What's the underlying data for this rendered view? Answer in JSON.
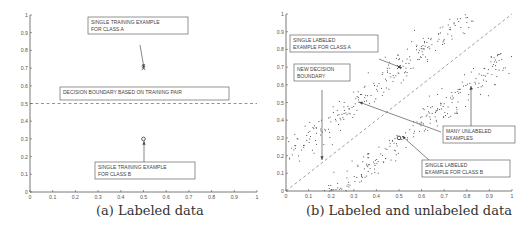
{
  "figure": {
    "panels": [
      {
        "id": "a",
        "caption": "(a) Labeled data",
        "annotations": {
          "class_a": [
            "SINGLE TRAINING EXAMPLE",
            "FOR CLASS A"
          ],
          "boundary": [
            "DECISION BOUNDARY BASED ON TRAINING PAIR"
          ],
          "class_b": [
            "SINGLE TRAINING EXAMPLE",
            "FOR CLASS B"
          ]
        }
      },
      {
        "id": "b",
        "caption": "(b) Labeled and unlabeled data",
        "annotations": {
          "class_a": [
            "SINGLE LABELED",
            "EXAMPLE FOR CLASS A"
          ],
          "boundary": [
            "NEW DECISION",
            "BOUNDARY"
          ],
          "unlabeled": [
            "MANY UNLABELED",
            "EXAMPLES"
          ],
          "class_b": [
            "SINGLE LABELED",
            "EXAMPLE FOR CLASS B"
          ]
        }
      }
    ],
    "ticks": [
      "0",
      "0.1",
      "0.2",
      "0.3",
      "0.4",
      "0.5",
      "0.6",
      "0.7",
      "0.8",
      "0.9",
      "1"
    ]
  },
  "chart_data": [
    {
      "type": "scatter",
      "title": "(a) Labeled data",
      "xlabel": "",
      "ylabel": "",
      "xlim": [
        0,
        1
      ],
      "ylim": [
        0,
        1
      ],
      "grid": false,
      "series": [
        {
          "name": "Class A labeled example",
          "marker": "x",
          "points": [
            [
              0.5,
              0.7
            ]
          ]
        },
        {
          "name": "Class B labeled example",
          "marker": "o",
          "points": [
            [
              0.5,
              0.3
            ]
          ]
        }
      ],
      "lines": [
        {
          "name": "Decision boundary based on training pair",
          "style": "dashed",
          "points": [
            [
              0,
              0.5
            ],
            [
              1,
              0.5
            ]
          ]
        }
      ],
      "annotations": [
        {
          "text": "SINGLE TRAINING EXAMPLE FOR CLASS A",
          "target": [
            0.5,
            0.7
          ]
        },
        {
          "text": "DECISION BOUNDARY BASED ON TRAINING PAIR",
          "target": [
            0.5,
            0.5
          ]
        },
        {
          "text": "SINGLE TRAINING EXAMPLE FOR CLASS B",
          "target": [
            0.5,
            0.3
          ]
        }
      ]
    },
    {
      "type": "scatter",
      "title": "(b) Labeled and unlabeled data",
      "xlabel": "",
      "ylabel": "",
      "xlim": [
        0,
        1
      ],
      "ylim": [
        0,
        1
      ],
      "grid": false,
      "series": [
        {
          "name": "Class A labeled example",
          "marker": "x",
          "points": [
            [
              0.5,
              0.7
            ]
          ]
        },
        {
          "name": "Class B labeled example",
          "marker": "o",
          "points": [
            [
              0.5,
              0.3
            ]
          ]
        },
        {
          "name": "Unlabeled cluster A (upper band, approx y = x + 0.2)",
          "marker": ".",
          "x_range": [
            0,
            0.9
          ],
          "y_range": [
            0.1,
            1.0
          ]
        },
        {
          "name": "Unlabeled cluster B (lower band, approx y = x - 0.2)",
          "marker": ".",
          "x_range": [
            0.15,
            1.0
          ],
          "y_range": [
            0.0,
            0.9
          ]
        }
      ],
      "lines": [
        {
          "name": "New decision boundary",
          "style": "dashed",
          "points": [
            [
              0,
              0
            ],
            [
              1,
              1
            ]
          ]
        }
      ],
      "annotations": [
        {
          "text": "SINGLE LABELED EXAMPLE FOR CLASS A",
          "target": [
            0.5,
            0.7
          ]
        },
        {
          "text": "NEW DECISION BOUNDARY",
          "target": [
            0.15,
            0.17
          ]
        },
        {
          "text": "MANY UNLABELED EXAMPLES",
          "target": [
            0.32,
            0.5
          ]
        },
        {
          "text": "SINGLE LABELED EXAMPLE FOR CLASS B",
          "target": [
            0.5,
            0.3
          ]
        }
      ]
    }
  ]
}
